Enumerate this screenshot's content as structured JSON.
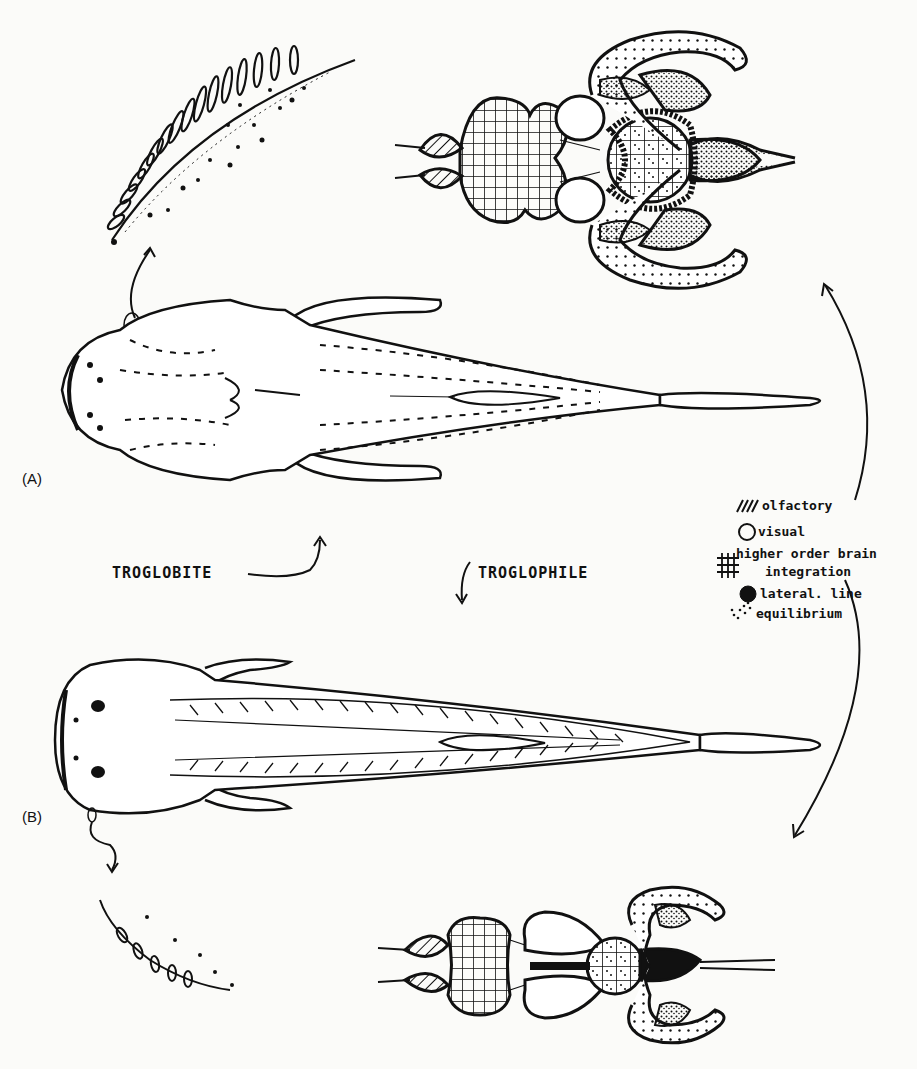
{
  "figure": {
    "panel_a_label": "(A)",
    "panel_b_label": "(B)",
    "troglobite_label": "TROGLOBITE",
    "troglophile_label": "TROGLOPHILE"
  },
  "legend": {
    "items": [
      {
        "icon": "diagonal-hatch-icon",
        "label": "olfactory"
      },
      {
        "icon": "open-circle-icon",
        "label": "visual"
      },
      {
        "icon": "grid-hatch-icon",
        "label": "higher order brain",
        "label2": "integration"
      },
      {
        "icon": "solid-blob-icon",
        "label": "lateral. line"
      },
      {
        "icon": "stipple-icon",
        "label": "equilibrium"
      }
    ]
  },
  "colors": {
    "ink": "#111111",
    "paper": "#fbfbf9"
  }
}
